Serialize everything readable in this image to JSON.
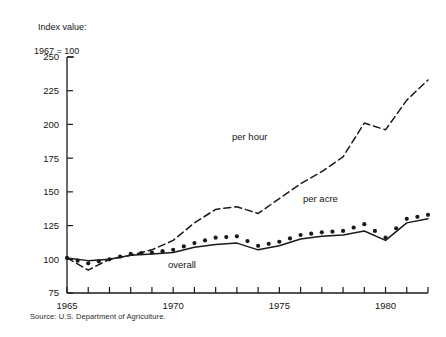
{
  "axis_title": {
    "line1": "Index value:",
    "line2": "1967 = 100"
  },
  "source": "Source: U.S. Department of Agriculture.",
  "labels": {
    "per_hour": "per hour",
    "per_acre": "per acre",
    "overall": "overall"
  },
  "chart_data": {
    "type": "line",
    "title": "",
    "subtitle": "",
    "xlabel": "",
    "ylabel": "Index value: 1967 = 100",
    "xlim": [
      1965,
      1982
    ],
    "ylim": [
      75,
      250
    ],
    "yticks": [
      75,
      100,
      125,
      150,
      175,
      200,
      225,
      250
    ],
    "ytick_labels": [
      "75",
      "100",
      "125",
      "150",
      "175",
      "200",
      "225",
      "250"
    ],
    "xticks": [
      1965,
      1966,
      1967,
      1968,
      1969,
      1970,
      1971,
      1972,
      1973,
      1974,
      1975,
      1976,
      1977,
      1978,
      1979,
      1980,
      1981,
      1982
    ],
    "xtick_labels_shown": [
      "1965",
      "1970",
      "1975",
      "1980"
    ],
    "xtick_labels_shown_at": [
      1965,
      1970,
      1975,
      1980
    ],
    "grid": false,
    "legend_position": "inline-annotations",
    "x": [
      1965,
      1966,
      1967,
      1968,
      1969,
      1970,
      1971,
      1972,
      1973,
      1974,
      1975,
      1976,
      1977,
      1978,
      1979,
      1980,
      1981,
      1982
    ],
    "series": [
      {
        "name": "per hour",
        "style": "dashed",
        "color": "#1a1a1a",
        "values": [
          101,
          92,
          100,
          103,
          107,
          114,
          127,
          137,
          139,
          134,
          145,
          156,
          165,
          176,
          201,
          196,
          218,
          233
        ]
      },
      {
        "name": "per acre",
        "style": "dotted",
        "color": "#1a1a1a",
        "values": [
          101,
          97,
          100,
          104,
          105,
          107,
          112,
          116,
          117,
          110,
          113,
          118,
          120,
          121,
          126,
          116,
          130,
          133
        ]
      },
      {
        "name": "overall",
        "style": "solid",
        "color": "#1a1a1a",
        "values": [
          101,
          99,
          100,
          103,
          104,
          105,
          109,
          111,
          112,
          107,
          110,
          115,
          117,
          118,
          121,
          114,
          127,
          130
        ]
      }
    ]
  }
}
